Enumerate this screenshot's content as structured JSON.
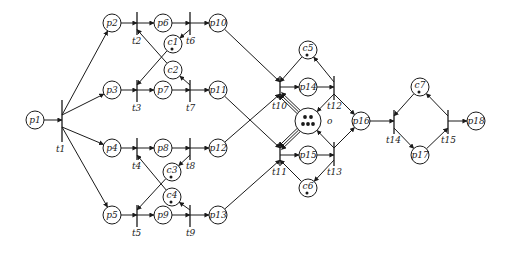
{
  "diagram": {
    "type": "petri-net",
    "colors": {
      "stroke": "#1a1a1a",
      "background": "#ffffff"
    },
    "places": [
      {
        "id": "p1",
        "label": "p1",
        "x": 35,
        "y": 120,
        "tokens": 0
      },
      {
        "id": "p2",
        "label": "p2",
        "x": 112,
        "y": 23,
        "tokens": 0
      },
      {
        "id": "p3",
        "label": "p3",
        "x": 112,
        "y": 90,
        "tokens": 0
      },
      {
        "id": "p4",
        "label": "p4",
        "x": 112,
        "y": 148,
        "tokens": 0
      },
      {
        "id": "p5",
        "label": "p5",
        "x": 112,
        "y": 215,
        "tokens": 0
      },
      {
        "id": "p6",
        "label": "p6",
        "x": 163,
        "y": 23,
        "tokens": 0
      },
      {
        "id": "p7",
        "label": "p7",
        "x": 163,
        "y": 90,
        "tokens": 0
      },
      {
        "id": "p8",
        "label": "p8",
        "x": 163,
        "y": 148,
        "tokens": 0
      },
      {
        "id": "p9",
        "label": "p9",
        "x": 163,
        "y": 215,
        "tokens": 0
      },
      {
        "id": "c1",
        "label": "c1",
        "x": 173,
        "y": 44,
        "tokens": 1
      },
      {
        "id": "c2",
        "label": "c2",
        "x": 173,
        "y": 70,
        "tokens": 0
      },
      {
        "id": "c3",
        "label": "c3",
        "x": 172,
        "y": 172,
        "tokens": 1
      },
      {
        "id": "c4",
        "label": "c4",
        "x": 172,
        "y": 197,
        "tokens": 1
      },
      {
        "id": "p10",
        "label": "p10",
        "x": 218,
        "y": 23,
        "tokens": 0
      },
      {
        "id": "p11",
        "label": "p11",
        "x": 218,
        "y": 90,
        "tokens": 0
      },
      {
        "id": "p12",
        "label": "p12",
        "x": 218,
        "y": 148,
        "tokens": 0
      },
      {
        "id": "p13",
        "label": "p13",
        "x": 218,
        "y": 215,
        "tokens": 0
      },
      {
        "id": "c5",
        "label": "c5",
        "x": 308,
        "y": 50,
        "tokens": 1
      },
      {
        "id": "p14",
        "label": "p14",
        "x": 308,
        "y": 87,
        "tokens": 0
      },
      {
        "id": "o",
        "label": "o",
        "x": 308,
        "y": 121,
        "tokens": 5,
        "big": true
      },
      {
        "id": "p15",
        "label": "p15",
        "x": 308,
        "y": 155,
        "tokens": 0
      },
      {
        "id": "c6",
        "label": "c6",
        "x": 308,
        "y": 188,
        "tokens": 1
      },
      {
        "id": "p16",
        "label": "p16",
        "x": 361,
        "y": 121,
        "tokens": 0
      },
      {
        "id": "c7",
        "label": "c7",
        "x": 420,
        "y": 87,
        "tokens": 1
      },
      {
        "id": "p17",
        "label": "p17",
        "x": 420,
        "y": 155,
        "tokens": 0
      },
      {
        "id": "p18",
        "label": "p18",
        "x": 476,
        "y": 121,
        "tokens": 0
      }
    ],
    "transitions": [
      {
        "id": "t1",
        "label": "t1",
        "x": 62,
        "y1": 100,
        "y2": 142,
        "lx": 56,
        "ly": 152
      },
      {
        "id": "t2",
        "label": "t2",
        "x": 137,
        "y1": 12,
        "y2": 35,
        "lx": 132,
        "ly": 44
      },
      {
        "id": "t3",
        "label": "t3",
        "x": 137,
        "y1": 80,
        "y2": 102,
        "lx": 132,
        "ly": 111
      },
      {
        "id": "t4",
        "label": "t4",
        "x": 137,
        "y1": 138,
        "y2": 160,
        "lx": 132,
        "ly": 169
      },
      {
        "id": "t5",
        "label": "t5",
        "x": 137,
        "y1": 205,
        "y2": 227,
        "lx": 132,
        "ly": 236
      },
      {
        "id": "t6",
        "label": "t6",
        "x": 190,
        "y1": 12,
        "y2": 35,
        "lx": 186,
        "ly": 44
      },
      {
        "id": "t7",
        "label": "t7",
        "x": 190,
        "y1": 80,
        "y2": 102,
        "lx": 186,
        "ly": 111
      },
      {
        "id": "t8",
        "label": "t8",
        "x": 190,
        "y1": 138,
        "y2": 160,
        "lx": 186,
        "ly": 169
      },
      {
        "id": "t9",
        "label": "t9",
        "x": 190,
        "y1": 205,
        "y2": 227,
        "lx": 186,
        "ly": 236
      },
      {
        "id": "t10",
        "label": "t10",
        "x": 280,
        "y1": 76,
        "y2": 100,
        "lx": 272,
        "ly": 109
      },
      {
        "id": "t11",
        "label": "t11",
        "x": 280,
        "y1": 142,
        "y2": 166,
        "lx": 272,
        "ly": 175
      },
      {
        "id": "t12",
        "label": "t12",
        "x": 334,
        "y1": 76,
        "y2": 100,
        "lx": 327,
        "ly": 109
      },
      {
        "id": "t13",
        "label": "t13",
        "x": 334,
        "y1": 142,
        "y2": 166,
        "lx": 327,
        "ly": 175
      },
      {
        "id": "t14",
        "label": "t14",
        "x": 394,
        "y1": 110,
        "y2": 134,
        "lx": 386,
        "ly": 143
      },
      {
        "id": "t15",
        "label": "t15",
        "x": 448,
        "y1": 110,
        "y2": 134,
        "lx": 441,
        "ly": 143
      }
    ],
    "arcs": [
      {
        "from": "p1",
        "to": "t1"
      },
      {
        "from": "t1",
        "to": "p2"
      },
      {
        "from": "t1",
        "to": "p3"
      },
      {
        "from": "t1",
        "to": "p4"
      },
      {
        "from": "t1",
        "to": "p5"
      },
      {
        "from": "p2",
        "to": "t2"
      },
      {
        "from": "t2",
        "to": "p6"
      },
      {
        "from": "p3",
        "to": "t3"
      },
      {
        "from": "t3",
        "to": "p7"
      },
      {
        "from": "p4",
        "to": "t4"
      },
      {
        "from": "t4",
        "to": "p8"
      },
      {
        "from": "p5",
        "to": "t5"
      },
      {
        "from": "t5",
        "to": "p9"
      },
      {
        "from": "c2",
        "to": "t2"
      },
      {
        "from": "c1",
        "to": "t3"
      },
      {
        "from": "t6",
        "to": "c1"
      },
      {
        "from": "t7",
        "to": "c2"
      },
      {
        "from": "c4",
        "to": "t4"
      },
      {
        "from": "c3",
        "to": "t5"
      },
      {
        "from": "t8",
        "to": "c3"
      },
      {
        "from": "t9",
        "to": "c4"
      },
      {
        "from": "p6",
        "to": "t6"
      },
      {
        "from": "t6",
        "to": "p10"
      },
      {
        "from": "p7",
        "to": "t7"
      },
      {
        "from": "t7",
        "to": "p11"
      },
      {
        "from": "p8",
        "to": "t8"
      },
      {
        "from": "t8",
        "to": "p12"
      },
      {
        "from": "p9",
        "to": "t9"
      },
      {
        "from": "t9",
        "to": "p13"
      },
      {
        "from": "p10",
        "to": "t10"
      },
      {
        "from": "p12",
        "to": "t10"
      },
      {
        "from": "p11",
        "to": "t11"
      },
      {
        "from": "p13",
        "to": "t11"
      },
      {
        "from": "c5",
        "to": "t10"
      },
      {
        "from": "t10",
        "to": "p14"
      },
      {
        "from": "o",
        "to": "t10",
        "multi": 3
      },
      {
        "from": "c6",
        "to": "t11"
      },
      {
        "from": "t11",
        "to": "p15"
      },
      {
        "from": "o",
        "to": "t11",
        "multi": 3
      },
      {
        "from": "p14",
        "to": "t12"
      },
      {
        "from": "t12",
        "to": "c5"
      },
      {
        "from": "t12",
        "to": "o"
      },
      {
        "from": "t12",
        "to": "p16"
      },
      {
        "from": "p15",
        "to": "t13"
      },
      {
        "from": "t13",
        "to": "c6"
      },
      {
        "from": "t13",
        "to": "o"
      },
      {
        "from": "t13",
        "to": "p16"
      },
      {
        "from": "p16",
        "to": "t14"
      },
      {
        "from": "c7",
        "to": "t14"
      },
      {
        "from": "t14",
        "to": "p17"
      },
      {
        "from": "p17",
        "to": "t15"
      },
      {
        "from": "t15",
        "to": "c7"
      },
      {
        "from": "t15",
        "to": "p18"
      }
    ]
  }
}
